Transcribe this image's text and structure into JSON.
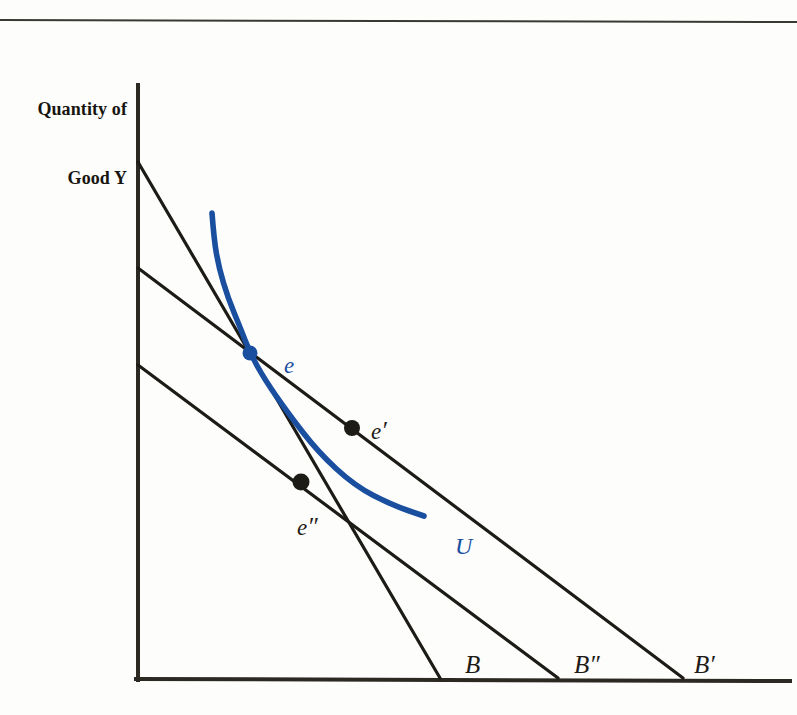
{
  "figure": {
    "type": "economics-indifference-curve-diagram",
    "background_color": "#fdfdfc",
    "line_color": "#1d1b16",
    "curve_color": "#1a4fa0"
  },
  "axes": {
    "y_title_line1": "Quantity of",
    "y_title_line2": "Good Y",
    "origin_px": [
      138,
      680
    ],
    "y_axis_top_px": 85,
    "x_axis_right_px": 790
  },
  "chart_data": {
    "type": "line",
    "title": "",
    "xlabel": "",
    "ylabel": "Quantity of Good Y",
    "grid": false,
    "legend": "none",
    "budget_lines": [
      {
        "name": "B",
        "label": "B",
        "label_pos_px": [
          441,
          628
        ],
        "y_intercept_px": [
          138,
          162
        ],
        "x_intercept_px": [
          440,
          678
        ],
        "description": "original budget line, steepest"
      },
      {
        "name": "B''",
        "label": "B",
        "prime": "″",
        "label_pos_px": [
          552,
          628
        ],
        "y_intercept_px": [
          138,
          365
        ],
        "x_intercept_px": [
          558,
          678
        ],
        "description": "compensated budget line, parallel to B'"
      },
      {
        "name": "B'",
        "label": "B",
        "prime": "′",
        "label_pos_px": [
          672,
          628
        ],
        "y_intercept_px": [
          138,
          268
        ],
        "x_intercept_px": [
          683,
          678
        ],
        "description": "new budget line after price change, flattest"
      }
    ],
    "indifference_curve": {
      "name": "U",
      "label": "U",
      "label_pos_px": [
        433,
        512
      ],
      "color": "#1a4fa0",
      "path_points_px": [
        [
          212,
          213
        ],
        [
          214,
          240
        ],
        [
          219,
          268
        ],
        [
          228,
          298
        ],
        [
          240,
          327
        ],
        [
          250,
          353
        ],
        [
          265,
          380
        ],
        [
          288,
          413
        ],
        [
          318,
          452
        ],
        [
          355,
          486
        ],
        [
          392,
          505
        ],
        [
          424,
          516
        ]
      ]
    },
    "points": [
      {
        "name": "e",
        "label": "e",
        "pos_px": [
          250,
          353
        ],
        "label_pos_px": [
          261,
          331
        ],
        "color": "#1a4fa0",
        "description": "original optimum, tangency of U and B"
      },
      {
        "name": "e'",
        "label": "e",
        "prime": "′",
        "pos_px": [
          352,
          428
        ],
        "label_pos_px": [
          351,
          396
        ],
        "color": "#1d1b16",
        "description": "new optimum on budget line B'"
      },
      {
        "name": "e''",
        "label": "e",
        "prime": "″",
        "pos_px": [
          301,
          482
        ],
        "label_pos_px": [
          277,
          493
        ],
        "color": "#1d1b16",
        "description": "compensated optimum on budget line B''"
      }
    ]
  }
}
